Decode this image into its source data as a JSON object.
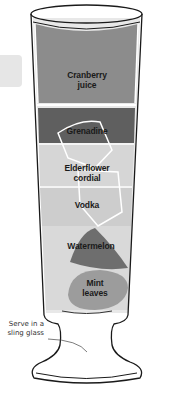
{
  "glass": {
    "type": "sling glass",
    "serve_note": "Serve in a sling glass"
  },
  "layers": [
    {
      "label_line1": "Cranberry",
      "label_line2": "juice",
      "color": "#8a8a8a"
    },
    {
      "label_line1": "Grenadine",
      "label_line2": "",
      "color": "#5e5e5e"
    },
    {
      "label_line1": "Elderflower",
      "label_line2": "cordial",
      "color": "#d4d4d4"
    },
    {
      "label_line1": "Vodka",
      "label_line2": "",
      "color": "#cfcfcf"
    },
    {
      "label_line1": "Watermelon",
      "label_line2": "",
      "color": "#707070"
    },
    {
      "label_line1": "Mint",
      "label_line2": "leaves",
      "color": "#9a9a9a"
    }
  ],
  "annotation": {
    "line1": "Serve in a",
    "line2": "sling glass"
  }
}
